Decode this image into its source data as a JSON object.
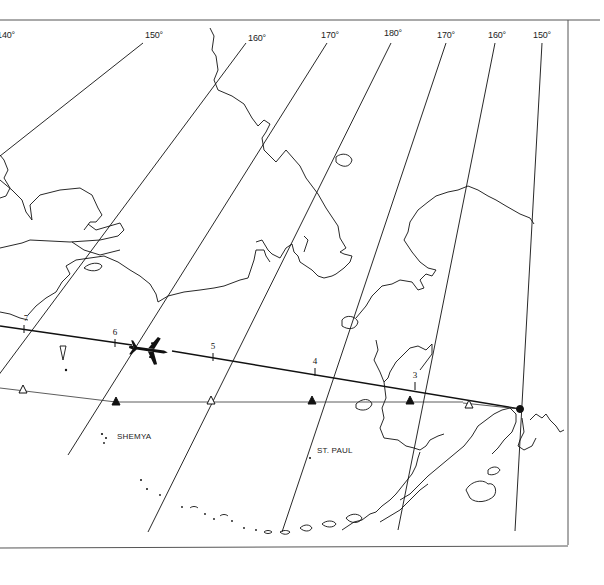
{
  "map": {
    "type": "flight-route-chart",
    "meridians": [
      {
        "label": "140°",
        "x": 6
      },
      {
        "label": "150°",
        "x": 154
      },
      {
        "label": "160°",
        "x": 257
      },
      {
        "label": "170°",
        "x": 330
      },
      {
        "label": "180°",
        "x": 393
      },
      {
        "label": "170°",
        "x": 446
      },
      {
        "label": "160°",
        "x": 497
      },
      {
        "label": "150°",
        "x": 542
      }
    ],
    "route_ticks": [
      {
        "label": "7",
        "x": 24,
        "y": 329
      },
      {
        "label": "6",
        "x": 115,
        "y": 343
      },
      {
        "label": "5",
        "x": 213,
        "y": 357
      },
      {
        "label": "4",
        "x": 315,
        "y": 372
      },
      {
        "label": "3",
        "x": 415,
        "y": 386
      }
    ],
    "waypoints": [
      {
        "kind": "hollow-triangle",
        "x": 23,
        "y": 390
      },
      {
        "kind": "filled-triangle",
        "x": 116,
        "y": 402
      },
      {
        "kind": "hollow-triangle",
        "x": 211,
        "y": 401
      },
      {
        "kind": "filled-triangle",
        "x": 312,
        "y": 401
      },
      {
        "kind": "filled-triangle",
        "x": 410,
        "y": 401
      },
      {
        "kind": "hollow-triangle",
        "x": 469,
        "y": 405
      },
      {
        "kind": "destination-dot",
        "x": 520,
        "y": 409
      }
    ],
    "places": [
      {
        "label": "SHEMYA",
        "x": 116,
        "y": 432
      },
      {
        "label": "ST. PAUL",
        "x": 316,
        "y": 446
      }
    ],
    "aircraft": {
      "icon": "airplane-icon",
      "x": 150,
      "y": 350
    }
  }
}
